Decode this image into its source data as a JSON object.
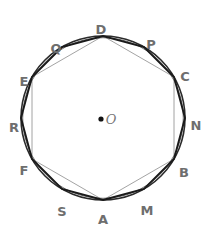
{
  "figure": {
    "center": {
      "label": "O",
      "x": 111,
      "y": 119,
      "dot_x": 101,
      "dot_y": 119
    },
    "circle": {
      "cx": 103,
      "cy": 118,
      "r": 82,
      "stroke": "#2b2b2b"
    },
    "colors": {
      "circle_stroke": "#2b2b2b",
      "dodecagon_stroke": "#1a1a1a",
      "hexagon_stroke": "#8c8c8c",
      "label_color": "#6e6e6e",
      "center_dot": "#111111",
      "background": "#ffffff"
    },
    "vertices": [
      {
        "name": "A",
        "angle_deg": 270,
        "px": 103,
        "py": 200,
        "label_x": 103,
        "label_y": 219
      },
      {
        "name": "M",
        "angle_deg": 300,
        "px": 144,
        "py": 189,
        "label_x": 147,
        "label_y": 210
      },
      {
        "name": "B",
        "angle_deg": 330,
        "px": 174,
        "py": 159,
        "label_x": 184,
        "label_y": 172
      },
      {
        "name": "N",
        "angle_deg": 0,
        "px": 185,
        "py": 118,
        "label_x": 196,
        "label_y": 125
      },
      {
        "name": "C",
        "angle_deg": 30,
        "px": 174,
        "py": 77,
        "label_x": 185,
        "label_y": 76
      },
      {
        "name": "P",
        "angle_deg": 60,
        "px": 144,
        "py": 47,
        "label_x": 151,
        "label_y": 44
      },
      {
        "name": "D",
        "angle_deg": 90,
        "px": 103,
        "py": 36,
        "label_x": 101,
        "label_y": 29
      },
      {
        "name": "Q",
        "angle_deg": 120,
        "px": 62,
        "py": 47,
        "label_x": 56,
        "label_y": 48
      },
      {
        "name": "E",
        "angle_deg": 150,
        "px": 32,
        "py": 77,
        "label_x": 24,
        "label_y": 81
      },
      {
        "name": "R",
        "angle_deg": 180,
        "px": 21,
        "py": 118,
        "label_x": 14,
        "label_y": 127
      },
      {
        "name": "F",
        "angle_deg": 210,
        "px": 32,
        "py": 159,
        "label_x": 24,
        "label_y": 170
      },
      {
        "name": "S",
        "angle_deg": 240,
        "px": 62,
        "py": 189,
        "label_x": 62,
        "label_y": 211
      }
    ],
    "dodecagon": {
      "name": "AMBNCPDQERFS",
      "points": "103,200 144,189 174,159 185,118 174,77 144,47 103,36 62,47 32,77 21,118 32,159 62,189",
      "stroke_width": 1.9
    },
    "hexagon": {
      "name": "ABCDEF",
      "points": "103,200 174,159 174,77 103,36 32,77 32,159",
      "stroke_width": 0.8
    }
  }
}
